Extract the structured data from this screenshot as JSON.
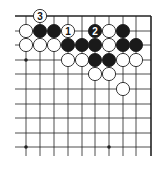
{
  "diagram": {
    "type": "go-board-corner",
    "grid": {
      "cols_x": [
        26,
        40,
        54,
        68,
        82,
        95,
        109,
        123,
        136,
        151
      ],
      "rows_y": [
        16,
        31,
        45,
        60,
        74,
        89,
        104,
        118,
        133,
        147
      ],
      "line_color": "#222222",
      "left_extent": 15,
      "bottom_extent": 156,
      "edges": [
        "top",
        "right"
      ]
    },
    "hoshi": [
      {
        "col": 0,
        "row": 3
      },
      {
        "col": 0,
        "row": 9
      },
      {
        "col": 6,
        "row": 9
      }
    ],
    "stones": [
      {
        "col": 1,
        "row": 0,
        "color": "white",
        "label": "3"
      },
      {
        "col": 0,
        "row": 1,
        "color": "white",
        "label": ""
      },
      {
        "col": 1,
        "row": 1,
        "color": "black",
        "label": ""
      },
      {
        "col": 2,
        "row": 1,
        "color": "black",
        "label": ""
      },
      {
        "col": 3,
        "row": 1,
        "color": "white",
        "label": "1"
      },
      {
        "col": 5,
        "row": 1,
        "color": "black",
        "label": "2"
      },
      {
        "col": 6,
        "row": 1,
        "color": "white",
        "label": ""
      },
      {
        "col": 7,
        "row": 1,
        "color": "black",
        "label": ""
      },
      {
        "col": 0,
        "row": 2,
        "color": "white",
        "label": ""
      },
      {
        "col": 1,
        "row": 2,
        "color": "white",
        "label": ""
      },
      {
        "col": 2,
        "row": 2,
        "color": "white",
        "label": ""
      },
      {
        "col": 3,
        "row": 2,
        "color": "black",
        "label": ""
      },
      {
        "col": 4,
        "row": 2,
        "color": "black",
        "label": ""
      },
      {
        "col": 5,
        "row": 2,
        "color": "black",
        "label": ""
      },
      {
        "col": 6,
        "row": 2,
        "color": "white",
        "label": ""
      },
      {
        "col": 7,
        "row": 2,
        "color": "black",
        "label": ""
      },
      {
        "col": 8,
        "row": 2,
        "color": "black",
        "label": ""
      },
      {
        "col": 3,
        "row": 3,
        "color": "white",
        "label": ""
      },
      {
        "col": 4,
        "row": 3,
        "color": "white",
        "label": ""
      },
      {
        "col": 5,
        "row": 3,
        "color": "black",
        "label": ""
      },
      {
        "col": 6,
        "row": 3,
        "color": "black",
        "label": ""
      },
      {
        "col": 7,
        "row": 3,
        "color": "white",
        "label": ""
      },
      {
        "col": 8,
        "row": 3,
        "color": "white",
        "label": ""
      },
      {
        "col": 5,
        "row": 4,
        "color": "white",
        "label": ""
      },
      {
        "col": 6,
        "row": 4,
        "color": "white",
        "label": ""
      },
      {
        "col": 7,
        "row": 5,
        "color": "white",
        "label": ""
      }
    ],
    "colors": {
      "black_stone": "#1a1a1a",
      "white_stone": "#ffffff",
      "stone_outline": "#222222",
      "label_on_black": "#ffffff",
      "label_on_white": "#111111"
    }
  }
}
